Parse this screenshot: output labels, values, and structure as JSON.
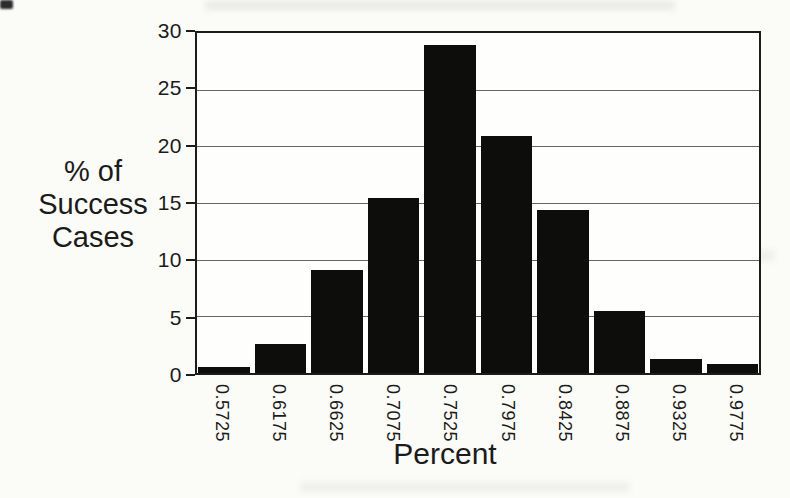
{
  "chart_data": {
    "type": "bar",
    "title": "",
    "categories": [
      "0.5725",
      "0.6175",
      "0.6625",
      "0.7075",
      "0.7525",
      "0.7975",
      "0.8425",
      "0.8875",
      "0.9325",
      "0.9775"
    ],
    "values": [
      0.5,
      2.6,
      9.1,
      15.4,
      28.9,
      20.9,
      14.4,
      5.5,
      1.2,
      0.8
    ],
    "xlabel": "Percent",
    "ylabel": "% of Success Cases",
    "ylabel_lines": [
      "% of",
      "Success",
      "Cases"
    ],
    "ylim": [
      0,
      30
    ],
    "yticks": [
      0,
      5,
      10,
      15,
      20,
      25,
      30
    ],
    "grid": true,
    "legend": "none",
    "bar_color": "#0d0d0c",
    "grid_color": "#4a4a4a",
    "frame_color": "#1c1c1c",
    "background_color": "#fbfbf8"
  }
}
